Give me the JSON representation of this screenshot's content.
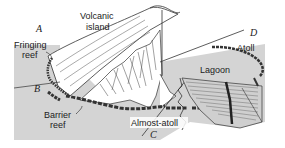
{
  "diagram": {
    "type": "reef-formation-stages",
    "colors": {
      "sea": "#d4d4d4",
      "line": "#333333",
      "background": "#ffffff"
    },
    "stage_letters": {
      "A": "A",
      "B": "B",
      "C": "C",
      "D": "D"
    },
    "labels": {
      "volcanic_island_1": "Volcanic",
      "volcanic_island_2": "island",
      "fringing_reef_1": "Fringing",
      "fringing_reef_2": "reef",
      "barrier_reef_1": "Barrier",
      "barrier_reef_2": "reef",
      "almost_atoll": "Almost-atoll",
      "lagoon": "Lagoon",
      "atoll": "Atoll"
    }
  }
}
